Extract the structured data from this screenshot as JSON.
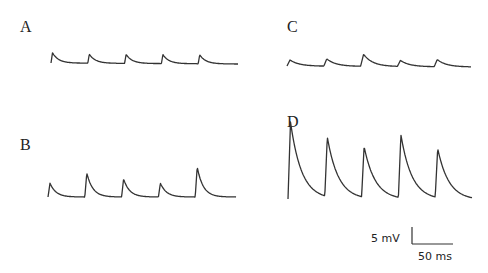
{
  "panels": [
    {
      "label": "A",
      "label_pos": [
        20,
        20
      ]
    },
    {
      "label": "B",
      "label_pos": [
        20,
        137
      ]
    },
    {
      "label": "C",
      "label_pos": [
        287,
        18
      ]
    },
    {
      "label": "D",
      "label_pos": [
        287,
        114
      ]
    }
  ],
  "scale_bar": {
    "voltage_label": "5 mV",
    "time_label": "50 ms"
  },
  "chart_data": {
    "type": "line",
    "title": "",
    "xlabel": "time",
    "ylabel": "membrane potential",
    "scale_bar": {
      "voltage_mV": 5,
      "time_ms": 50
    },
    "series": [
      {
        "name": "A",
        "event_times_ms": [
          0,
          46,
          92,
          138,
          184
        ],
        "amplitudes_mV": [
          1.7,
          1.5,
          1.5,
          1.5,
          1.5
        ]
      },
      {
        "name": "B",
        "event_times_ms": [
          0,
          46,
          92,
          138,
          184
        ],
        "amplitudes_mV": [
          2.3,
          4.0,
          3.0,
          2.3,
          5.0
        ]
      },
      {
        "name": "C",
        "event_times_ms": [
          0,
          46,
          92,
          138,
          184
        ],
        "amplitudes_mV": [
          1.0,
          1.2,
          2.0,
          1.0,
          1.2
        ]
      },
      {
        "name": "D",
        "event_times_ms": [
          0,
          46,
          92,
          138,
          184
        ],
        "amplitudes_mV": [
          22.0,
          17.0,
          14.5,
          18.0,
          14.0
        ]
      }
    ]
  }
}
